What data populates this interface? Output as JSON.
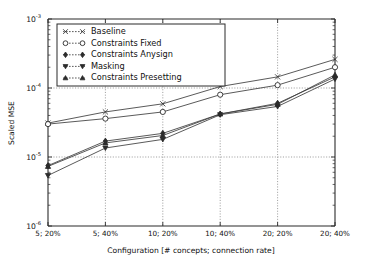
{
  "chart_data": {
    "type": "line",
    "title": "",
    "xlabel": "Configuration [# concepts; connection rate]",
    "ylabel": "Scaled MSE",
    "categories": [
      "5; 20%",
      "5; 40%",
      "10; 20%",
      "10; 40%",
      "20; 20%",
      "20; 40%"
    ],
    "yscale": "log",
    "ylim": [
      1e-06,
      0.001
    ],
    "ytick_labels": [
      "10-6",
      "10-5",
      "10-4",
      "10-3"
    ],
    "ytick_values": [
      1e-06,
      1e-05,
      0.0001,
      0.001
    ],
    "grid": true,
    "legend_position": "upper left",
    "series": [
      {
        "name": "Baseline",
        "marker": "x",
        "values": [
          3.1e-05,
          4.5e-05,
          5.9e-05,
          0.000105,
          0.000145,
          0.00026
        ]
      },
      {
        "name": "Constraints Fixed",
        "marker": "circle-open",
        "values": [
          3e-05,
          3.6e-05,
          4.5e-05,
          8e-05,
          0.00011,
          0.0002
        ]
      },
      {
        "name": "Constraints Anysign",
        "marker": "diamond",
        "values": [
          7.5e-06,
          1.7e-05,
          2.2e-05,
          4.2e-05,
          6e-05,
          0.000145
        ]
      },
      {
        "name": "Masking",
        "marker": "triangle-down",
        "values": [
          5.4e-06,
          1.35e-05,
          1.8e-05,
          4.1e-05,
          5.4e-05,
          0.000135
        ]
      },
      {
        "name": "Constraints Presetting",
        "marker": "triangle-up",
        "values": [
          7.3e-06,
          1.6e-05,
          2.05e-05,
          4.2e-05,
          5.8e-05,
          0.000155
        ]
      }
    ]
  },
  "axes": {
    "y_label": "Scaled MSE",
    "x_label": "Configuration [# concepts; connection rate]",
    "y_ticks": [
      {
        "base": "10",
        "exp": "-3"
      },
      {
        "base": "10",
        "exp": "-4"
      },
      {
        "base": "10",
        "exp": "-5"
      },
      {
        "base": "10",
        "exp": "-6"
      }
    ],
    "x_ticks": [
      "5; 20%",
      "5; 40%",
      "10; 20%",
      "10; 40%",
      "20; 20%",
      "20; 40%"
    ]
  },
  "legend": {
    "items": [
      {
        "label": "Baseline",
        "marker": "x-icon"
      },
      {
        "label": "Constraints Fixed",
        "marker": "circle-icon"
      },
      {
        "label": "Constraints Anysign",
        "marker": "diamond-icon"
      },
      {
        "label": "Masking",
        "marker": "triangle-down-icon"
      },
      {
        "label": "Constraints Presetting",
        "marker": "triangle-up-icon"
      }
    ]
  },
  "colors": {
    "line": "#3c3c3c",
    "axis": "#2b2b2b",
    "grid": "#7a7a7a",
    "background": "#ffffff"
  }
}
